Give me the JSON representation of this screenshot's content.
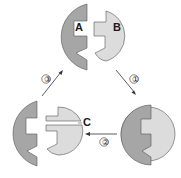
{
  "diagram": {
    "type": "enzyme-substrate cycle",
    "labels": {
      "enzyme": "A",
      "substrate": "B",
      "product_cut": "C"
    },
    "steps": [
      {
        "id": "step-1",
        "label": "①"
      },
      {
        "id": "step-2",
        "label": "②"
      },
      {
        "id": "step-3",
        "label": "③"
      }
    ],
    "colors": {
      "enzyme_fill": "#a6a6a6",
      "substrate_fill": "#dcdcdc",
      "outline": "#555555",
      "arrow": "#333333",
      "background": "#ffffff"
    }
  }
}
